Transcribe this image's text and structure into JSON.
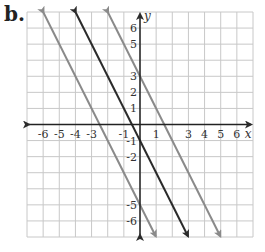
{
  "part_label": "b.",
  "chart_data": {
    "type": "line",
    "title": "",
    "xlabel": "x",
    "ylabel": "y",
    "xlim": [
      -7,
      7
    ],
    "ylim": [
      -7,
      7
    ],
    "grid": true,
    "x_tick_labels": [
      "-6",
      "-5",
      "-4",
      "-3",
      "-1",
      "1",
      "3",
      "4",
      "5",
      "6"
    ],
    "x_tick_values": [
      -6,
      -5,
      -4,
      -3,
      -1,
      1,
      3,
      4,
      5,
      6
    ],
    "y_tick_labels": [
      "6",
      "5",
      "3",
      "2",
      "1",
      "-1",
      "-2",
      "-5",
      "-6"
    ],
    "y_tick_values": [
      6,
      5,
      3,
      2,
      1,
      -1,
      -2,
      -5,
      -6
    ],
    "series": [
      {
        "name": "y = -2x + 3",
        "slope": -2,
        "intercept": 3,
        "color": "#8a8a8a"
      },
      {
        "name": "y = -2x - 1",
        "slope": -2,
        "intercept": -1,
        "color": "#2b2b2b"
      },
      {
        "name": "y = -2x - 5",
        "slope": -2,
        "intercept": -5,
        "color": "#8a8a8a"
      }
    ]
  }
}
